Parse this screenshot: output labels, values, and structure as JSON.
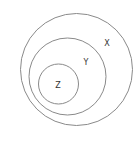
{
  "diagram": {
    "type": "nested-venn",
    "stroke_color": "#8a8a8a",
    "label_color": "#333333",
    "sets": [
      {
        "name": "X",
        "label": "X",
        "cx": 76.5,
        "cy": 69.5,
        "r": 56,
        "label_x": 107,
        "label_y": 43
      },
      {
        "name": "Y",
        "label": "Y",
        "cx": 67.5,
        "cy": 76.5,
        "r": 38.5,
        "label_x": 86,
        "label_y": 62
      },
      {
        "name": "Z",
        "label": "Z",
        "cx": 58.5,
        "cy": 84,
        "r": 20,
        "label_x": 58,
        "label_y": 85
      }
    ]
  }
}
